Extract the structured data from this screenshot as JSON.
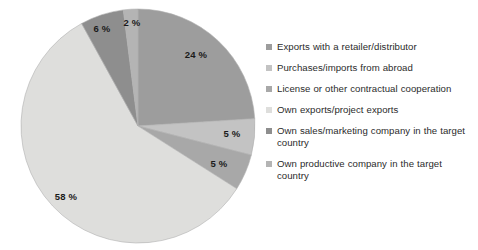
{
  "chart_data": {
    "type": "pie",
    "title": "",
    "subtitle": "",
    "xlabel": "",
    "ylabel": "",
    "unit": "%",
    "legend_position": "right",
    "grid": false,
    "start_angle_deg": 0,
    "direction": "clockwise",
    "categories": [
      "Exports with a retailer/distributor",
      "Purchases/imports from abroad",
      "License or other contractual cooperation",
      "Own exports/project exports",
      "Own sales/marketing company in the target country",
      "Own productive company in the target country"
    ],
    "values": [
      24,
      5,
      5,
      58,
      6,
      2
    ],
    "data_labels": [
      "24 %",
      "5 %",
      "5 %",
      "58 %",
      "6 %",
      "2 %"
    ],
    "colors": [
      "#9d9d9d",
      "#c3c3c3",
      "#a8a8a8",
      "#dededc",
      "#8e8e8e",
      "#b4b4b4"
    ],
    "outline_color": "#b0b0b0"
  },
  "pie": {
    "center_x": 138,
    "center_y": 126,
    "radius": 117,
    "slices": [
      {
        "name": "exports-with-retailer-distributor",
        "label": "24 %",
        "value": 24,
        "color": "#9d9d9d",
        "label_x": 196,
        "label_y": 58
      },
      {
        "name": "purchases-imports-from-abroad",
        "label": "5 %",
        "value": 5,
        "color": "#c3c3c3",
        "label_x": 232,
        "label_y": 137
      },
      {
        "name": "license-or-contractual-cooperation",
        "label": "5 %",
        "value": 5,
        "color": "#a8a8a8",
        "label_x": 219,
        "label_y": 167
      },
      {
        "name": "own-exports-project-exports",
        "label": "58 %",
        "value": 58,
        "color": "#dededc",
        "label_x": 66,
        "label_y": 200
      },
      {
        "name": "own-sales-marketing-company",
        "label": "6 %",
        "value": 6,
        "color": "#8e8e8e",
        "label_x": 102,
        "label_y": 32
      },
      {
        "name": "own-productive-company",
        "label": "2 %",
        "value": 2,
        "color": "#b4b4b4",
        "label_x": 132,
        "label_y": 26
      }
    ]
  },
  "legend": {
    "items": [
      {
        "label": "Exports with a retailer/distributor",
        "color": "#9d9d9d",
        "name": "legend-item-exports-with-retailer-distributor"
      },
      {
        "label": "Purchases/imports from abroad",
        "color": "#c3c3c3",
        "name": "legend-item-purchases-imports-from-abroad"
      },
      {
        "label": "License or other contractual cooperation",
        "color": "#a8a8a8",
        "name": "legend-item-license-or-contractual-cooperation"
      },
      {
        "label": "Own exports/project exports",
        "color": "#dededc",
        "name": "legend-item-own-exports-project-exports"
      },
      {
        "label": "Own sales/marketing company in the target country",
        "color": "#8e8e8e",
        "name": "legend-item-own-sales-marketing-company"
      },
      {
        "label": "Own productive company in the target country",
        "color": "#b4b4b4",
        "name": "legend-item-own-productive-company"
      }
    ]
  }
}
